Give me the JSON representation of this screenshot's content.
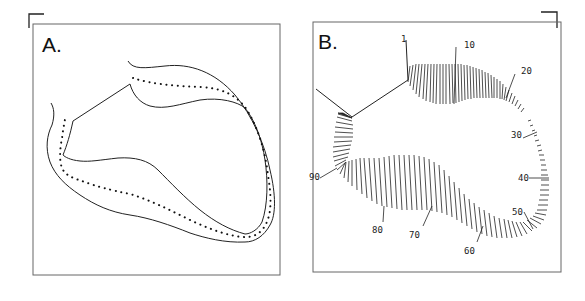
{
  "figure": {
    "panels": [
      {
        "id": "A",
        "label": "A.",
        "description": "Ventricular wall outline (endocardial and epicardial contours) with dotted centerline"
      },
      {
        "id": "B",
        "label": "B.",
        "description": "Centerline chord method: chords drawn perpendicular to centerline, numbered 1 to 100",
        "chord_labels": [
          "1",
          "10",
          "20",
          "30",
          "40",
          "50",
          "60",
          "70",
          "80",
          "90"
        ]
      }
    ],
    "colors": {
      "ink": "#1a1a1a",
      "border": "#555555",
      "background": "#ffffff"
    }
  }
}
